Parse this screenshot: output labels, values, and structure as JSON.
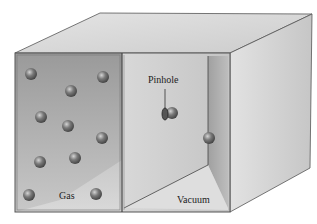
{
  "figure": {
    "labels": {
      "gas": "Gas",
      "vacuum": "Vacuum",
      "pinhole": "Pinhole"
    },
    "chambers": [
      {
        "name": "gas-chamber",
        "label": "Gas",
        "molecule_count": 11
      },
      {
        "name": "vacuum-chamber",
        "label": "Vacuum",
        "molecule_count": 1
      }
    ],
    "molecules_gas": [
      {
        "x": 31,
        "y": 74
      },
      {
        "x": 103,
        "y": 77
      },
      {
        "x": 71,
        "y": 91
      },
      {
        "x": 41,
        "y": 117
      },
      {
        "x": 68,
        "y": 126
      },
      {
        "x": 102,
        "y": 138
      },
      {
        "x": 40,
        "y": 162
      },
      {
        "x": 75,
        "y": 158
      },
      {
        "x": 29,
        "y": 195
      },
      {
        "x": 96,
        "y": 194
      }
    ],
    "molecule_pinhole": {
      "x": 171,
      "y": 113
    },
    "molecule_vacuum": {
      "x": 209,
      "y": 138
    },
    "colors": {
      "gas_wall": "#a8a8a8",
      "vacuum_wall": "#d4d4d4",
      "top_face": "#d9d9d9",
      "side_face": "#cfcfcf",
      "edge": "#555555",
      "molecule": "#6e6e6e"
    }
  }
}
